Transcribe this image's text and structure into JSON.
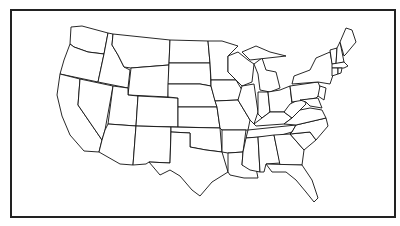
{
  "map": {
    "title": "",
    "subject": "Blank outline map of the contiguous United States",
    "line_color": "#111111",
    "background": "#ffffff",
    "frame_color": "#222222",
    "labels": []
  }
}
